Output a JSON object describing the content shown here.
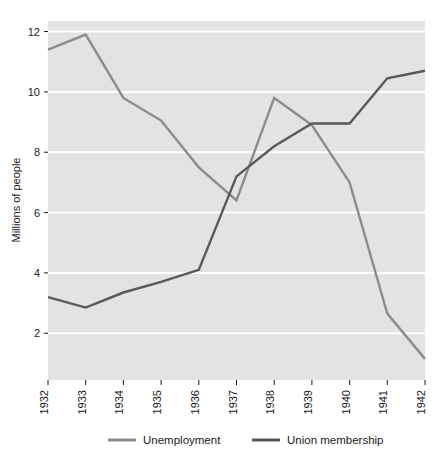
{
  "chart_data": {
    "type": "line",
    "title": "",
    "xlabel": "",
    "ylabel": "Millions of people",
    "x": [
      1932,
      1933,
      1934,
      1935,
      1936,
      1937,
      1938,
      1939,
      1940,
      1941,
      1942
    ],
    "categories": [
      "1932",
      "1933",
      "1934",
      "1935",
      "1936",
      "1937",
      "1938",
      "1939",
      "1940",
      "1941",
      "1942"
    ],
    "series": [
      {
        "name": "Unemployment",
        "color": "#8c8c8c",
        "values": [
          11.4,
          11.9,
          9.8,
          9.05,
          7.5,
          6.4,
          9.8,
          8.9,
          7.0,
          2.65,
          1.15
        ]
      },
      {
        "name": "Union membership",
        "color": "#595959",
        "values": [
          3.2,
          2.85,
          3.35,
          3.7,
          4.1,
          7.2,
          8.2,
          8.95,
          8.95,
          10.45,
          10.7
        ]
      }
    ],
    "ylim": [
      0.45,
      12.35
    ],
    "xlim": [
      1932,
      1942
    ],
    "yticks": [
      2,
      4,
      6,
      8,
      10,
      12
    ],
    "ytick_labels": [
      "2",
      "4",
      "6",
      "8",
      "10",
      "12"
    ],
    "grid": true,
    "gridline_color": "#ffffff",
    "plot_background": "#e3e3e3",
    "figure_background": "#ffffff",
    "legend_position": "bottom",
    "legend": [
      {
        "label": "Unemployment",
        "color": "#8c8c8c"
      },
      {
        "label": "Union membership",
        "color": "#595959"
      }
    ]
  }
}
